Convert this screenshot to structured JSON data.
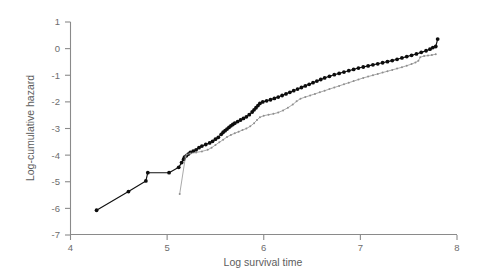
{
  "chart_data": {
    "type": "line",
    "title": "",
    "subtitle": "",
    "xlabel": "Log survival time",
    "ylabel": "Log-cumulative hazard",
    "xlim": [
      4,
      8
    ],
    "ylim": [
      -7,
      1
    ],
    "xticks": [
      4,
      5,
      6,
      7,
      8
    ],
    "yticks": [
      1,
      0,
      -1,
      -2,
      -3,
      -4,
      -5,
      -6,
      -7
    ],
    "xtick_labels": [
      "4",
      "5",
      "6",
      "7",
      "8"
    ],
    "ytick_labels": [
      "1",
      "0",
      "-1",
      "-2",
      "-3",
      "-4",
      "-5",
      "-6",
      "-7"
    ],
    "grid": false,
    "legend": null,
    "legend_position": "none",
    "annotations": [],
    "series": [
      {
        "name": "group-1",
        "style": "line-with-markers",
        "color": "#101010",
        "marker": "filled-circle",
        "points": [
          [
            4.27,
            -6.07
          ],
          [
            4.6,
            -5.37
          ],
          [
            4.78,
            -4.97
          ],
          [
            4.8,
            -4.66
          ],
          [
            5.02,
            -4.66
          ],
          [
            5.12,
            -4.46
          ],
          [
            5.15,
            -4.28
          ],
          [
            5.17,
            -4.16
          ],
          [
            5.18,
            -4.08
          ],
          [
            5.2,
            -4.02
          ],
          [
            5.22,
            -3.96
          ],
          [
            5.24,
            -3.9
          ],
          [
            5.27,
            -3.85
          ],
          [
            5.3,
            -3.8
          ],
          [
            5.33,
            -3.72
          ],
          [
            5.36,
            -3.66
          ],
          [
            5.4,
            -3.6
          ],
          [
            5.44,
            -3.54
          ],
          [
            5.47,
            -3.48
          ],
          [
            5.5,
            -3.4
          ],
          [
            5.53,
            -3.33
          ],
          [
            5.56,
            -3.22
          ],
          [
            5.58,
            -3.14
          ],
          [
            5.6,
            -3.08
          ],
          [
            5.62,
            -3.02
          ],
          [
            5.64,
            -2.96
          ],
          [
            5.66,
            -2.9
          ],
          [
            5.68,
            -2.85
          ],
          [
            5.7,
            -2.8
          ],
          [
            5.73,
            -2.74
          ],
          [
            5.76,
            -2.68
          ],
          [
            5.79,
            -2.62
          ],
          [
            5.82,
            -2.56
          ],
          [
            5.85,
            -2.48
          ],
          [
            5.88,
            -2.38
          ],
          [
            5.9,
            -2.3
          ],
          [
            5.92,
            -2.22
          ],
          [
            5.94,
            -2.14
          ],
          [
            5.96,
            -2.06
          ],
          [
            5.99,
            -2.0
          ],
          [
            6.03,
            -1.96
          ],
          [
            6.07,
            -1.92
          ],
          [
            6.11,
            -1.87
          ],
          [
            6.15,
            -1.82
          ],
          [
            6.19,
            -1.76
          ],
          [
            6.23,
            -1.7
          ],
          [
            6.27,
            -1.64
          ],
          [
            6.31,
            -1.58
          ],
          [
            6.35,
            -1.52
          ],
          [
            6.39,
            -1.46
          ],
          [
            6.43,
            -1.4
          ],
          [
            6.47,
            -1.34
          ],
          [
            6.51,
            -1.28
          ],
          [
            6.55,
            -1.22
          ],
          [
            6.59,
            -1.16
          ],
          [
            6.63,
            -1.1
          ],
          [
            6.68,
            -1.04
          ],
          [
            6.73,
            -0.98
          ],
          [
            6.78,
            -0.93
          ],
          [
            6.83,
            -0.88
          ],
          [
            6.88,
            -0.83
          ],
          [
            6.93,
            -0.78
          ],
          [
            6.98,
            -0.73
          ],
          [
            7.03,
            -0.69
          ],
          [
            7.08,
            -0.65
          ],
          [
            7.13,
            -0.61
          ],
          [
            7.18,
            -0.57
          ],
          [
            7.23,
            -0.53
          ],
          [
            7.28,
            -0.49
          ],
          [
            7.33,
            -0.45
          ],
          [
            7.38,
            -0.4
          ],
          [
            7.43,
            -0.35
          ],
          [
            7.48,
            -0.3
          ],
          [
            7.53,
            -0.25
          ],
          [
            7.58,
            -0.2
          ],
          [
            7.63,
            -0.14
          ],
          [
            7.68,
            -0.08
          ],
          [
            7.72,
            -0.02
          ],
          [
            7.75,
            0.04
          ],
          [
            7.78,
            0.08
          ],
          [
            7.8,
            0.36
          ]
        ]
      },
      {
        "name": "group-2",
        "style": "line-with-markers",
        "color": "#9a9a9a",
        "marker": "small-cross",
        "points": [
          [
            5.13,
            -5.46
          ],
          [
            5.19,
            -4.06
          ],
          [
            5.2,
            -3.98
          ],
          [
            5.24,
            -3.94
          ],
          [
            5.3,
            -3.9
          ],
          [
            5.36,
            -3.86
          ],
          [
            5.42,
            -3.8
          ],
          [
            5.46,
            -3.72
          ],
          [
            5.5,
            -3.62
          ],
          [
            5.54,
            -3.52
          ],
          [
            5.58,
            -3.42
          ],
          [
            5.62,
            -3.32
          ],
          [
            5.66,
            -3.24
          ],
          [
            5.7,
            -3.18
          ],
          [
            5.74,
            -3.12
          ],
          [
            5.78,
            -3.06
          ],
          [
            5.82,
            -3.0
          ],
          [
            5.86,
            -2.92
          ],
          [
            5.9,
            -2.8
          ],
          [
            5.93,
            -2.68
          ],
          [
            5.96,
            -2.58
          ],
          [
            6.0,
            -2.52
          ],
          [
            6.05,
            -2.48
          ],
          [
            6.1,
            -2.45
          ],
          [
            6.15,
            -2.4
          ],
          [
            6.2,
            -2.32
          ],
          [
            6.25,
            -2.22
          ],
          [
            6.3,
            -2.1
          ],
          [
            6.34,
            -1.98
          ],
          [
            6.38,
            -1.88
          ],
          [
            6.43,
            -1.82
          ],
          [
            6.48,
            -1.76
          ],
          [
            6.53,
            -1.7
          ],
          [
            6.58,
            -1.64
          ],
          [
            6.63,
            -1.58
          ],
          [
            6.68,
            -1.52
          ],
          [
            6.73,
            -1.46
          ],
          [
            6.78,
            -1.4
          ],
          [
            6.83,
            -1.34
          ],
          [
            6.88,
            -1.28
          ],
          [
            6.93,
            -1.22
          ],
          [
            6.98,
            -1.16
          ],
          [
            7.03,
            -1.1
          ],
          [
            7.08,
            -1.05
          ],
          [
            7.13,
            -1.0
          ],
          [
            7.18,
            -0.95
          ],
          [
            7.23,
            -0.9
          ],
          [
            7.28,
            -0.85
          ],
          [
            7.33,
            -0.8
          ],
          [
            7.38,
            -0.75
          ],
          [
            7.43,
            -0.7
          ],
          [
            7.48,
            -0.64
          ],
          [
            7.53,
            -0.58
          ],
          [
            7.57,
            -0.52
          ],
          [
            7.6,
            -0.46
          ],
          [
            7.62,
            -0.32
          ],
          [
            7.66,
            -0.28
          ],
          [
            7.7,
            -0.26
          ],
          [
            7.74,
            -0.24
          ],
          [
            7.78,
            -0.21
          ]
        ]
      }
    ]
  },
  "axis": {
    "x_title": "Log survival time",
    "y_title": "Log-cumulative hazard"
  }
}
